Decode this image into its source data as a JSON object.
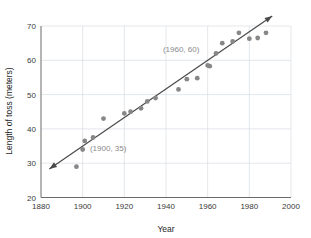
{
  "chart_data": {
    "type": "scatter",
    "title": "",
    "xlabel": "Year",
    "ylabel": "Length of toss (meters)",
    "xlim": [
      1880,
      2000
    ],
    "ylim": [
      20,
      70
    ],
    "xticks": [
      1880,
      1900,
      1920,
      1940,
      1960,
      1980,
      2000
    ],
    "xtick_labels": [
      "1880",
      "1900",
      "1920",
      "1940",
      "1960",
      "1980",
      "2000"
    ],
    "yticks": [
      20,
      30,
      40,
      50,
      60,
      70
    ],
    "ytick_labels": [
      "20",
      "30",
      "40",
      "50",
      "60",
      "70"
    ],
    "grid": true,
    "legend": null,
    "point_color": "#878787",
    "line_color": "#4a4a4a",
    "grid_color": "#d8dde3",
    "annotation_color": "#8a8a8a",
    "series": [
      {
        "name": "Length of toss",
        "x": [
          1897,
          1900,
          1901,
          1905,
          1910,
          1920,
          1923,
          1928,
          1931,
          1935,
          1946,
          1950,
          1955,
          1960,
          1961,
          1964,
          1967,
          1972,
          1975,
          1980,
          1984,
          1988
        ],
        "y": [
          29.0,
          34.0,
          36.5,
          37.5,
          43.0,
          44.5,
          45.0,
          46.0,
          48.0,
          49.0,
          51.5,
          54.5,
          54.8,
          58.5,
          58.3,
          62.0,
          65.0,
          65.5,
          68.0,
          66.3,
          66.5,
          68.0
        ]
      }
    ],
    "trend_line": {
      "name": "line of best fit",
      "points": [
        [
          1900,
          35
        ],
        [
          1960,
          60
        ]
      ],
      "slope": 0.4167,
      "intercept": -756.7,
      "x_start": 1884,
      "x_end": 1991,
      "arrows": "both"
    },
    "annotations": [
      {
        "label": "(1900, 35)",
        "x": 1900,
        "y": 35,
        "text_x": 1903.5,
        "text_y": 33.6
      },
      {
        "label": "(1960, 60)",
        "x": 1960,
        "y": 60,
        "text_x": 1938.5,
        "text_y": 62.4
      }
    ]
  }
}
